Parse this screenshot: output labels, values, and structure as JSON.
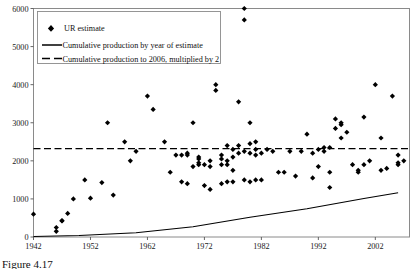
{
  "chart_data": {
    "type": "scatter",
    "title": "",
    "xlabel": "",
    "ylabel": "",
    "xlim": [
      1942,
      2008
    ],
    "ylim": [
      0,
      6000
    ],
    "xticks": [
      1942,
      1952,
      1962,
      1972,
      1982,
      1992,
      2002
    ],
    "yticks": [
      0,
      1000,
      2000,
      3000,
      4000,
      5000,
      6000
    ],
    "grid": false,
    "legend_position": "top-left",
    "legend": [
      {
        "label": "UR estimate",
        "marker": "diamond",
        "color": "#000000"
      },
      {
        "label": "Cumulative production by year of estimate",
        "marker": "solid-line",
        "color": "#000000"
      },
      {
        "label": "Cumulative production to 2006, multiplied by 2",
        "marker": "dashed-line",
        "color": "#000000"
      }
    ],
    "series": [
      {
        "name": "UR estimate",
        "type": "scatter",
        "marker": "diamond",
        "color": "#000000",
        "points": [
          [
            1942,
            600
          ],
          [
            1946,
            150
          ],
          [
            1946,
            250
          ],
          [
            1947,
            430
          ],
          [
            1947,
            420
          ],
          [
            1948,
            620
          ],
          [
            1949,
            1000
          ],
          [
            1951,
            1500
          ],
          [
            1952,
            1020
          ],
          [
            1954,
            1430
          ],
          [
            1955,
            3000
          ],
          [
            1956,
            1100
          ],
          [
            1958,
            2500
          ],
          [
            1959,
            2000
          ],
          [
            1960,
            2250
          ],
          [
            1962,
            3700
          ],
          [
            1963,
            3350
          ],
          [
            1965,
            2500
          ],
          [
            1966,
            1700
          ],
          [
            1967,
            2150
          ],
          [
            1968,
            1450
          ],
          [
            1968,
            2150
          ],
          [
            1969,
            1400
          ],
          [
            1969,
            2200
          ],
          [
            1969,
            2150
          ],
          [
            1970,
            1850
          ],
          [
            1970,
            3000
          ],
          [
            1971,
            1900
          ],
          [
            1971,
            2100
          ],
          [
            1971,
            2050
          ],
          [
            1971,
            1950
          ],
          [
            1972,
            1350
          ],
          [
            1972,
            1900
          ],
          [
            1973,
            2000
          ],
          [
            1973,
            1850
          ],
          [
            1973,
            1250
          ],
          [
            1974,
            4000
          ],
          [
            1974,
            3850
          ],
          [
            1975,
            2050
          ],
          [
            1975,
            1900
          ],
          [
            1975,
            1400
          ],
          [
            1975,
            2150
          ],
          [
            1976,
            2400
          ],
          [
            1976,
            1900
          ],
          [
            1976,
            1450
          ],
          [
            1976,
            2000
          ],
          [
            1977,
            2300
          ],
          [
            1977,
            1750
          ],
          [
            1977,
            2100
          ],
          [
            1977,
            1450
          ],
          [
            1978,
            2200
          ],
          [
            1978,
            3550
          ],
          [
            1978,
            2400
          ],
          [
            1979,
            6000
          ],
          [
            1979,
            5700
          ],
          [
            1979,
            2250
          ],
          [
            1979,
            1500
          ],
          [
            1980,
            2450
          ],
          [
            1980,
            2200
          ],
          [
            1980,
            1450
          ],
          [
            1980,
            3000
          ],
          [
            1981,
            2500
          ],
          [
            1981,
            2300
          ],
          [
            1981,
            2150
          ],
          [
            1981,
            1500
          ],
          [
            1982,
            2200
          ],
          [
            1982,
            1500
          ],
          [
            1983,
            2300
          ],
          [
            1984,
            2250
          ],
          [
            1985,
            1700
          ],
          [
            1986,
            1700
          ],
          [
            1987,
            2250
          ],
          [
            1988,
            1600
          ],
          [
            1989,
            2250
          ],
          [
            1990,
            2700
          ],
          [
            1991,
            2200
          ],
          [
            1991,
            1550
          ],
          [
            1992,
            2300
          ],
          [
            1992,
            1850
          ],
          [
            1993,
            2250
          ],
          [
            1993,
            2350
          ],
          [
            1994,
            2350
          ],
          [
            1994,
            1700
          ],
          [
            1994,
            1300
          ],
          [
            1995,
            3100
          ],
          [
            1995,
            2850
          ],
          [
            1996,
            3000
          ],
          [
            1996,
            2600
          ],
          [
            1996,
            2950
          ],
          [
            1997,
            2750
          ],
          [
            1998,
            1900
          ],
          [
            1999,
            1750
          ],
          [
            1999,
            1700
          ],
          [
            2000,
            3150
          ],
          [
            2000,
            1900
          ],
          [
            2001,
            2000
          ],
          [
            2002,
            4000
          ],
          [
            2003,
            2600
          ],
          [
            2003,
            1750
          ],
          [
            2004,
            1800
          ],
          [
            2005,
            3700
          ],
          [
            2006,
            2150
          ],
          [
            2006,
            1900
          ],
          [
            2006,
            1950
          ],
          [
            2007,
            2000
          ]
        ]
      },
      {
        "name": "Cumulative production by year of estimate",
        "type": "line",
        "style": "solid",
        "color": "#000000",
        "x": [
          1942,
          1950,
          1960,
          1970,
          1980,
          1990,
          2000,
          2006
        ],
        "y": [
          15,
          40,
          110,
          270,
          520,
          740,
          1010,
          1160
        ]
      },
      {
        "name": "Cumulative production to 2006, multiplied by 2",
        "type": "hline",
        "style": "dashed",
        "color": "#000000",
        "value": 2320
      }
    ]
  },
  "caption": {
    "text": "Figure 4.17"
  }
}
